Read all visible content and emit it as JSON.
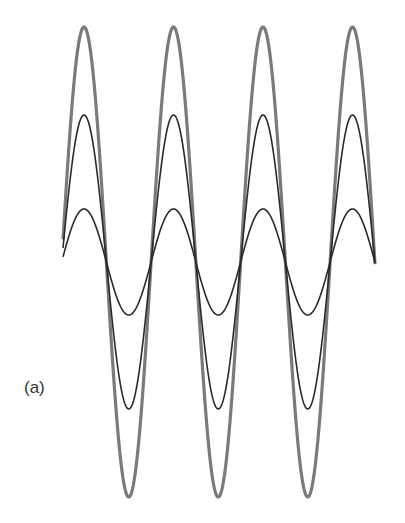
{
  "figure": {
    "panel_label": "(a)"
  },
  "chart_data": {
    "type": "line",
    "title": "",
    "xlabel": "",
    "ylabel": "",
    "grid": false,
    "axes_visible": false,
    "geometry_px": {
      "x_start": 63,
      "x_end": 375,
      "baseline_y": 262,
      "period": 89.5,
      "first_peak_x": 84
    },
    "series": [
      {
        "name": "large-amplitude",
        "amplitude_px": 235,
        "color": "#7a7a7a",
        "stroke_width": 3.2
      },
      {
        "name": "medium-amplitude",
        "amplitude_px": 147,
        "color": "#2a2a2a",
        "stroke_width": 1.6
      },
      {
        "name": "small-amplitude",
        "amplitude_px": 53,
        "color": "#2a2a2a",
        "stroke_width": 1.6
      }
    ]
  }
}
